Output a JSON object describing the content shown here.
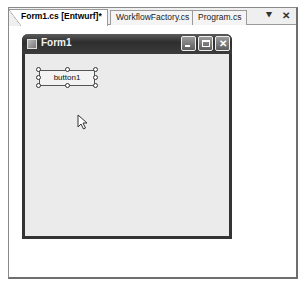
{
  "tabs": [
    {
      "label": "Form1.cs [Entwurf]*",
      "active": true
    },
    {
      "label": "WorkflowFactory.cs",
      "active": false
    },
    {
      "label": "Program.cs",
      "active": false
    }
  ],
  "tab_controls": {
    "dropdown_icon": "window-position-icon",
    "close_icon": "close-icon",
    "dropdown_glyph": "⯆",
    "close_glyph": "✕"
  },
  "form": {
    "title": "Form1",
    "minimize_icon": "minimize-icon",
    "maximize_icon": "maximize-icon",
    "close_glyph": "✕",
    "button": {
      "label": "button1",
      "selected": true
    }
  },
  "colors": {
    "titlebar": "#333333",
    "client": "#ebebeb",
    "frame_border": "#6e6e6e"
  }
}
